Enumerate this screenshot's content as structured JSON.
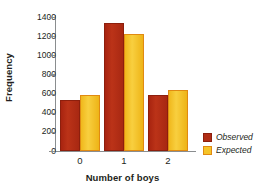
{
  "chart_data": {
    "type": "bar",
    "title": "",
    "xlabel": "Number of boys",
    "ylabel": "Frequency",
    "categories": [
      "0",
      "1",
      "2"
    ],
    "series": [
      {
        "name": "Observed",
        "color": "#b02d15",
        "values": [
          533,
          1337,
          585
        ]
      },
      {
        "name": "Expected",
        "color": "#f5c429",
        "values": [
          585,
          1222,
          637
        ]
      }
    ],
    "ylim": [
      0,
      1400
    ],
    "yticks": [
      0,
      200,
      400,
      600,
      800,
      1000,
      1200,
      1400
    ],
    "ytick_labels": [
      "0",
      "200",
      "400",
      "600",
      "800",
      "1000",
      "1200",
      "1400"
    ],
    "grid": false,
    "legend_position": "right-bottom",
    "legend": [
      {
        "label": "Observed",
        "swatch": "observed-swatch"
      },
      {
        "label": "Expected",
        "swatch": "expected-swatch"
      }
    ]
  }
}
